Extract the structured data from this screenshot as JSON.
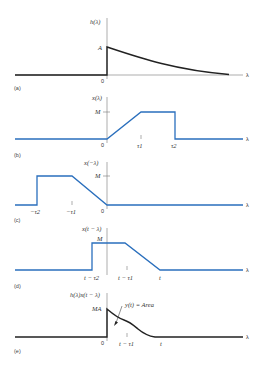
{
  "figure": {
    "panels": [
      {
        "id": "a",
        "label": "(a)",
        "ylabel": "h(λ)",
        "xlabel": "λ",
        "level_label": "A",
        "origin_label": "0",
        "curve": "exponential decay starting at A at λ=0"
      },
      {
        "id": "b",
        "label": "(b)",
        "ylabel": "x(λ)",
        "xlabel": "λ",
        "level_label": "M",
        "origin_label": "0",
        "ticks": [
          "τ1",
          "τ2"
        ],
        "curve": "ramp from 0 to M at τ1, flat until τ2, then drop"
      },
      {
        "id": "c",
        "label": "(c)",
        "ylabel": "x(−λ)",
        "xlabel": "λ",
        "level_label": "M",
        "origin_label": "0",
        "ticks": [
          "−τ2",
          "−τ1"
        ],
        "curve": "mirror of (b)"
      },
      {
        "id": "d",
        "label": "(d)",
        "ylabel": "x(t − λ)",
        "xlabel": "λ",
        "level_label": "M",
        "ticks": [
          "t − τ2",
          "t − τ1",
          "t"
        ],
        "curve": "shifted mirror"
      },
      {
        "id": "e",
        "label": "(e)",
        "ylabel": "h(λ)x(t − λ)",
        "xlabel": "λ",
        "level_label": "MA",
        "origin_label": "0",
        "ticks": [
          "t − τ1",
          "t"
        ],
        "annotation": "y(t) = Area",
        "curve": "product curve from MA at 0 decaying to 0 at t"
      }
    ]
  },
  "colors": {
    "signal_blue": "#2a6fbd",
    "impulse_black": "#222222",
    "axis_gray": "#777777"
  }
}
